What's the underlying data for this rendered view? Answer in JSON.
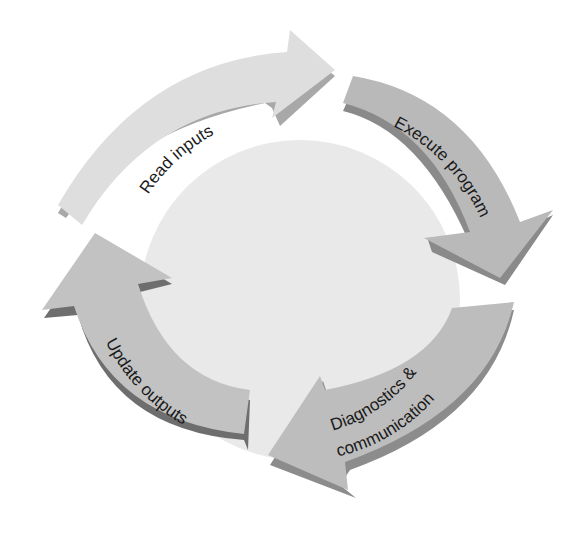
{
  "diagram": {
    "type": "cycle",
    "title": "",
    "center": {
      "fill": "#e9e9e9"
    },
    "steps": [
      {
        "id": "read-inputs",
        "label": "Read inputs",
        "lines": [
          "Read inputs"
        ],
        "fill": "#dedede",
        "side": "#a8a8a8"
      },
      {
        "id": "execute-program",
        "label": "Execute program",
        "lines": [
          "Execute program"
        ],
        "fill": "#b9b9b9",
        "side": "#8a8a8a"
      },
      {
        "id": "diagnostics-communication",
        "label": "Diagnostics & communication",
        "lines": [
          "Diagnostics &",
          "communication"
        ],
        "fill": "#bdbdbd",
        "side": "#8c8c8c"
      },
      {
        "id": "update-outputs",
        "label": "Update outputs",
        "lines": [
          "Update outputs"
        ],
        "fill": "#c2c2c2",
        "side": "#6e6e6e"
      }
    ],
    "flow": [
      "read-inputs",
      "execute-program",
      "diagnostics-communication",
      "update-outputs",
      "read-inputs"
    ]
  }
}
